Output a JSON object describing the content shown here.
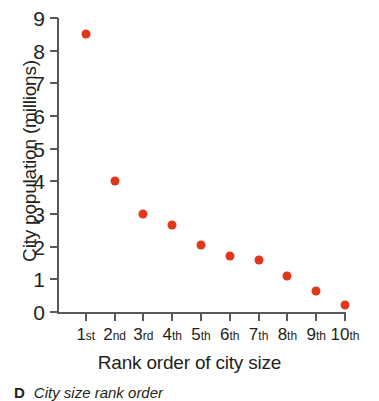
{
  "chart_data": {
    "type": "scatter",
    "title": "",
    "xlabel": "Rank order of city size",
    "ylabel": "City population (millions)",
    "categories": [
      "1st",
      "2nd",
      "3rd",
      "4th",
      "5th",
      "6th",
      "7th",
      "8th",
      "9th",
      "10th"
    ],
    "category_numbers": [
      "1",
      "2",
      "3",
      "4",
      "5",
      "6",
      "7",
      "8",
      "9",
      "10"
    ],
    "category_suffixes": [
      "st",
      "nd",
      "rd",
      "th",
      "th",
      "th",
      "th",
      "th",
      "th",
      "th"
    ],
    "values": [
      8.5,
      4.0,
      3.0,
      2.67,
      2.05,
      1.7,
      1.6,
      1.1,
      0.65,
      0.2
    ],
    "ylim": [
      0,
      9
    ],
    "yticks": [
      "0",
      "1",
      "2",
      "3",
      "4",
      "5",
      "6",
      "7",
      "8",
      "9"
    ],
    "ytick_values": [
      0,
      1,
      2,
      3,
      4,
      5,
      6,
      7,
      8,
      9
    ],
    "grid": false,
    "legend": false,
    "marker_color": "#e0371a",
    "axis_color": "#58595b",
    "text_color": "#231f20",
    "background": "#ffffff"
  },
  "caption": {
    "letter": "D",
    "text": "City size rank order"
  }
}
